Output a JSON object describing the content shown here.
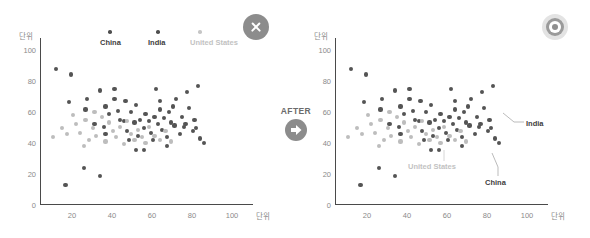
{
  "panels": {
    "before": {
      "name": "before-chart",
      "badge_icon": "close-circle-icon",
      "legend": [
        {
          "label": "China",
          "color": "#4f4f4f",
          "tone": "dark"
        },
        {
          "label": "India",
          "color": "#4f4f4f",
          "tone": "dark"
        },
        {
          "label": "United States",
          "color": "#c6c6c6",
          "tone": "light"
        }
      ]
    },
    "after": {
      "name": "after-chart",
      "badge_icon": "target-circle-icon",
      "annotations": [
        {
          "label": "India",
          "color": "#3d3d3d",
          "tone": "dark"
        },
        {
          "label": "United States",
          "color": "#c2c2c2",
          "tone": "light"
        },
        {
          "label": "China",
          "color": "#3d3d3d",
          "tone": "dark"
        }
      ]
    }
  },
  "transition": {
    "label": "AFTER",
    "icon": "arrow-right-circle-icon"
  },
  "axes": {
    "y_unit": "단위",
    "x_unit": "단위",
    "y_ticks": [
      "0",
      "20",
      "40",
      "60",
      "80",
      "100"
    ],
    "x_ticks": [
      "20",
      "40",
      "60",
      "80",
      "100"
    ]
  },
  "chart_data": {
    "type": "scatter",
    "title": "",
    "xlabel": "단위",
    "ylabel": "단위",
    "xlim": [
      0,
      110
    ],
    "ylim": [
      0,
      110
    ],
    "grid": false,
    "legend_position": "top",
    "series": [
      {
        "name": "China",
        "color": "#545454",
        "points": [
          [
            9,
            93
          ],
          [
            17,
            89
          ],
          [
            16,
            70
          ],
          [
            26,
            72
          ],
          [
            25,
            65
          ],
          [
            33,
            78
          ],
          [
            36,
            67
          ],
          [
            38,
            62
          ],
          [
            41,
            79
          ],
          [
            41,
            72
          ],
          [
            44,
            58
          ],
          [
            46,
            57
          ],
          [
            47,
            71
          ],
          [
            50,
            63
          ],
          [
            52,
            56
          ],
          [
            53,
            68
          ],
          [
            55,
            58
          ],
          [
            57,
            52
          ],
          [
            58,
            62
          ],
          [
            60,
            57
          ],
          [
            61,
            49
          ],
          [
            63,
            60
          ],
          [
            64,
            79
          ],
          [
            65,
            55
          ],
          [
            66,
            65
          ],
          [
            67,
            51
          ],
          [
            68,
            59
          ],
          [
            70,
            46
          ],
          [
            71,
            63
          ],
          [
            72,
            56
          ],
          [
            74,
            54
          ],
          [
            75,
            72
          ],
          [
            77,
            48
          ],
          [
            78,
            60
          ],
          [
            79,
            53
          ],
          [
            81,
            77
          ],
          [
            82,
            66
          ],
          [
            84,
            50
          ],
          [
            85,
            58
          ],
          [
            87,
            81
          ],
          [
            88,
            45
          ],
          [
            90,
            42
          ],
          [
            24,
            25
          ],
          [
            33,
            19
          ],
          [
            14,
            13
          ],
          [
            53,
            37
          ],
          [
            57,
            37
          ],
          [
            36,
            48
          ],
          [
            49,
            44
          ],
          [
            70,
            40
          ]
        ]
      },
      {
        "name": "India",
        "color": "#545454",
        "points": [
          [
            30,
            55
          ],
          [
            35,
            53
          ],
          [
            43,
            64
          ],
          [
            48,
            50
          ],
          [
            54,
            47
          ],
          [
            62,
            44
          ],
          [
            66,
            71
          ],
          [
            73,
            67
          ],
          [
            80,
            55
          ],
          [
            86,
            52
          ]
        ]
      },
      {
        "name": "United States",
        "color": "#bdbdbd",
        "points": [
          [
            7,
            46
          ],
          [
            12,
            52
          ],
          [
            15,
            48
          ],
          [
            20,
            55
          ],
          [
            22,
            49
          ],
          [
            25,
            58
          ],
          [
            27,
            44
          ],
          [
            29,
            52
          ],
          [
            31,
            47
          ],
          [
            34,
            60
          ],
          [
            36,
            43
          ],
          [
            38,
            56
          ],
          [
            40,
            50
          ],
          [
            42,
            46
          ],
          [
            44,
            53
          ],
          [
            46,
            41
          ],
          [
            48,
            57
          ],
          [
            50,
            48
          ],
          [
            52,
            44
          ],
          [
            54,
            51
          ],
          [
            56,
            46
          ],
          [
            58,
            42
          ],
          [
            60,
            53
          ],
          [
            63,
            47
          ],
          [
            66,
            44
          ],
          [
            69,
            50
          ],
          [
            72,
            43
          ],
          [
            18,
            61
          ],
          [
            24,
            40
          ],
          [
            30,
            63
          ]
        ]
      }
    ]
  }
}
